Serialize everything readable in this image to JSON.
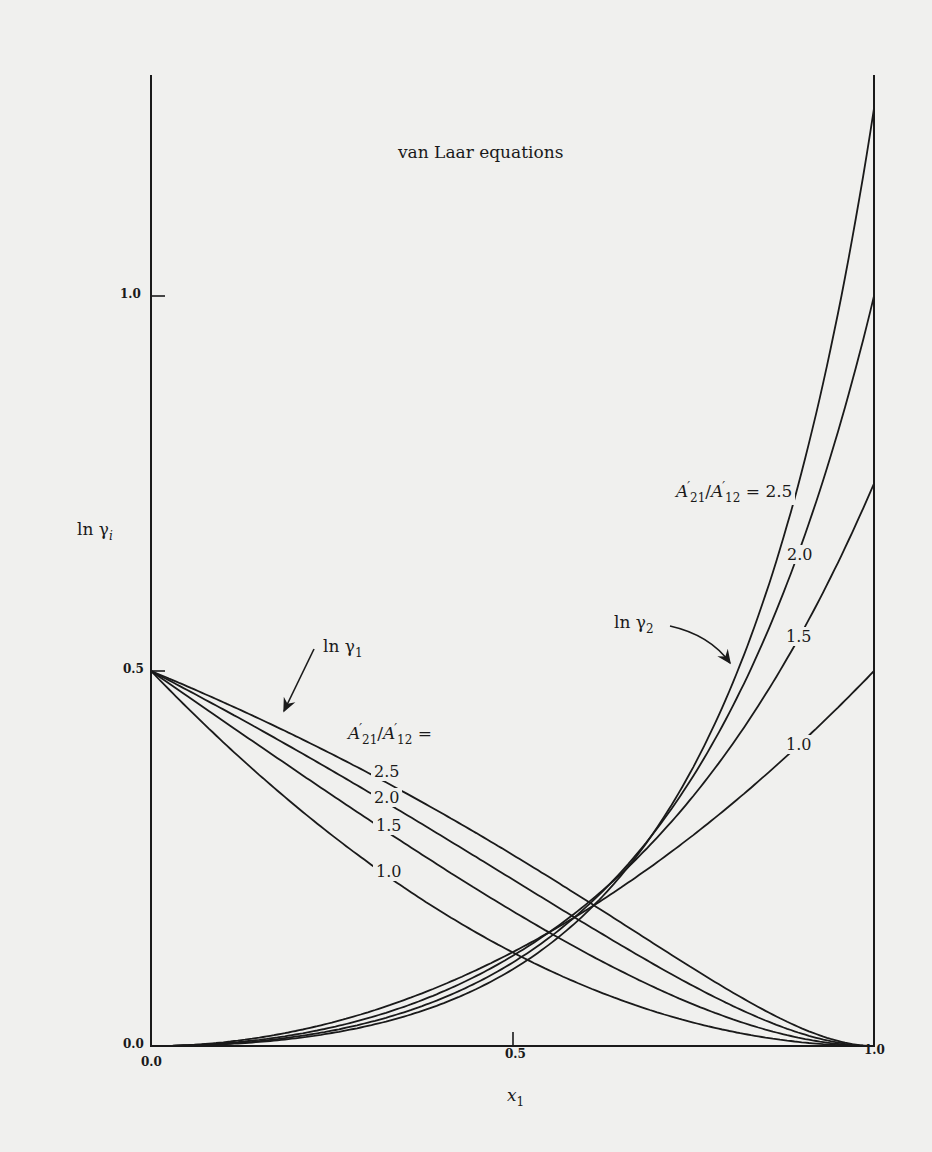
{
  "chart_data": {
    "type": "line",
    "title": "van Laar equations",
    "xlabel": "x1",
    "ylabel": "ln γi",
    "xlim": [
      0.0,
      1.0
    ],
    "ylim": [
      0.0,
      1.25
    ],
    "grid": false,
    "legend": "inline labels",
    "x_ticks": [
      "0.0",
      "0.5",
      "1.0"
    ],
    "y_ticks": [
      "0.0",
      "0.5",
      "1.0"
    ],
    "parameters": {
      "A12_prime": 0.5,
      "ratio_label": "A'21/A'12",
      "ratios": [
        1.0,
        1.5,
        2.0,
        2.5
      ]
    },
    "x": [
      0.0,
      0.1,
      0.2,
      0.3,
      0.4,
      0.5,
      0.6,
      0.7,
      0.8,
      0.9,
      1.0
    ],
    "series": [
      {
        "name": "ln γ1, A'21/A'12 = 1.0",
        "values": [
          0.5,
          0.405,
          0.32,
          0.245,
          0.18,
          0.125,
          0.08,
          0.045,
          0.02,
          0.005,
          0.0
        ]
      },
      {
        "name": "ln γ1, A'21/A'12 = 1.5",
        "values": [
          0.5,
          0.433,
          0.367,
          0.303,
          0.24,
          0.18,
          0.125,
          0.077,
          0.037,
          0.01,
          0.0
        ]
      },
      {
        "name": "ln γ1, A'21/A'12 = 2.0",
        "values": [
          0.5,
          0.449,
          0.395,
          0.339,
          0.281,
          0.222,
          0.163,
          0.107,
          0.056,
          0.017,
          0.0
        ]
      },
      {
        "name": "ln γ1, A'21/A'12 = 2.5",
        "values": [
          0.5,
          0.458,
          0.413,
          0.364,
          0.312,
          0.255,
          0.195,
          0.134,
          0.074,
          0.024,
          0.0
        ]
      },
      {
        "name": "ln γ2, A'21/A'12 = 1.0",
        "values": [
          0.0,
          0.005,
          0.02,
          0.045,
          0.08,
          0.125,
          0.18,
          0.245,
          0.32,
          0.405,
          0.5
        ]
      },
      {
        "name": "ln γ2, A'21/A'12 = 1.5",
        "values": [
          0.0,
          0.004,
          0.015,
          0.037,
          0.071,
          0.12,
          0.188,
          0.278,
          0.397,
          0.551,
          0.75
        ]
      },
      {
        "name": "ln γ2, A'21/A'12 = 2.0",
        "values": [
          0.0,
          0.003,
          0.012,
          0.031,
          0.063,
          0.111,
          0.184,
          0.29,
          0.444,
          0.669,
          1.0
        ]
      },
      {
        "name": "ln γ2, A'21/A'12 = 2.5",
        "values": [
          0.0,
          0.002,
          0.01,
          0.027,
          0.055,
          0.102,
          0.176,
          0.291,
          0.473,
          0.766,
          1.25
        ]
      }
    ],
    "annotations": [
      {
        "text": "ln γ1",
        "arrow_to": "ln γ1 curves near x1≈0.35"
      },
      {
        "text": "ln γ2",
        "arrow_to": "ln γ2 curves near x1≈0.82"
      },
      {
        "text": "A'21/A'12 =",
        "labels": [
          "2.5",
          "2.0",
          "1.5",
          "1.0"
        ],
        "for": "ln γ1"
      },
      {
        "text": "A'21/A'12 = 2.5",
        "labels": [
          "2.5",
          "2.0",
          "1.5",
          "1.0"
        ],
        "for": "ln γ2"
      }
    ]
  },
  "labels": {
    "title": "van Laar equations",
    "y_axis_ln": "ln γ",
    "y_axis_sub": "i",
    "x_axis_var": "x",
    "x_axis_sub": "1",
    "tick_x0": "0.0",
    "tick_x05": "0.5",
    "tick_x1": "1.0",
    "tick_y0": "0.0",
    "tick_y05": "0.5",
    "tick_y1": "1.0",
    "ln_gamma1": "ln γ",
    "ln_gamma1_sub": "1",
    "ln_gamma2": "ln γ",
    "ln_gamma2_sub": "2",
    "ratio_A": "A",
    "ratio_21": "21",
    "ratio_12": "12",
    "ratio_slash": "/",
    "ratio_eq": " =",
    "ratio_eq_val": " = 2.5",
    "left_r25": "2.5",
    "left_r20": "2.0",
    "left_r15": "1.5",
    "left_r10": "1.0",
    "right_r20": "2.0",
    "right_r15": "1.5",
    "right_r10": "1.0"
  },
  "style": {
    "line_color": "#1a1a1a",
    "background": "#f0f0ee"
  }
}
